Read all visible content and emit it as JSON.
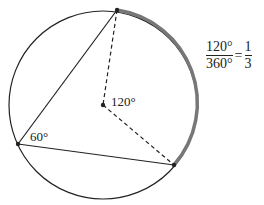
{
  "diagram": {
    "center_angle_label": "120°",
    "inscribed_angle_label": "60°",
    "fraction": {
      "numerator": "120°",
      "denominator": "360°",
      "equals": "=",
      "result_numerator": "1",
      "result_denominator": "3"
    },
    "colors": {
      "stroke": "#222222",
      "arc_highlight": "#777777"
    }
  }
}
